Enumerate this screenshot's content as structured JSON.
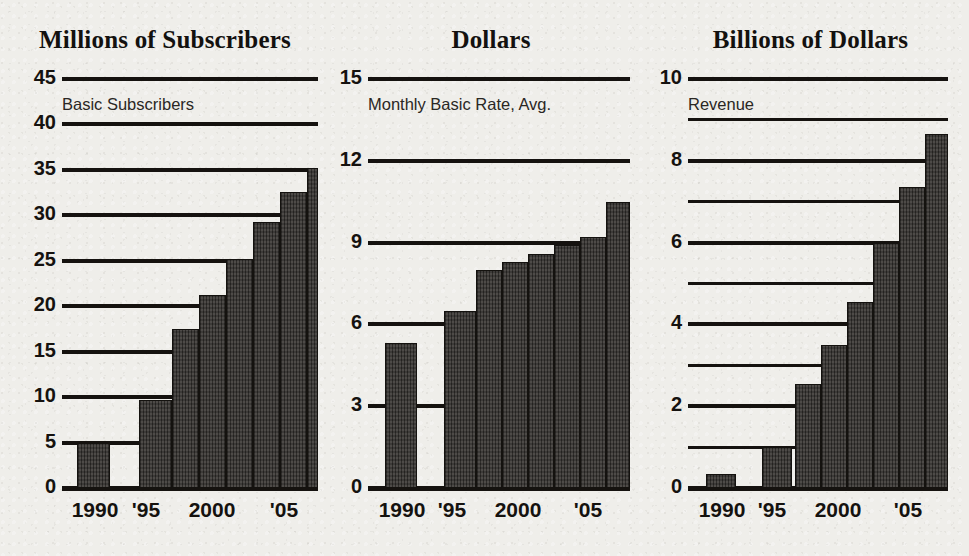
{
  "page": {
    "background_color": "#efeeea",
    "ink_color": "#15120f",
    "bar_color": "#3a3734"
  },
  "chart_data": [
    {
      "type": "bar",
      "title": "Millions of Subscribers",
      "subtitle": "Basic Subscribers",
      "xlabel": "",
      "ylabel": "Millions of Subscribers",
      "ylim": [
        0,
        45
      ],
      "grid": true,
      "legend": "none",
      "y_major_ticks": [
        0,
        5,
        10,
        15,
        20,
        25,
        30,
        35,
        40,
        45
      ],
      "y_minor_ticks": [],
      "x_tick_labels": [
        "1990",
        "'95",
        "2000",
        "'05"
      ],
      "categories": [
        "1990",
        "1995",
        "1998",
        "1999",
        "2000",
        "2001",
        "2002",
        "2003",
        "2004",
        "2005"
      ],
      "values": [
        5.0,
        9.7,
        17.5,
        21.2,
        25.2,
        29.3,
        32.6,
        35.2,
        35.2,
        35.2
      ]
    },
    {
      "type": "bar",
      "title": "Dollars",
      "subtitle": "Monthly Basic Rate, Avg.",
      "xlabel": "",
      "ylabel": "Dollars",
      "ylim": [
        0,
        15
      ],
      "grid": true,
      "legend": "none",
      "y_major_ticks": [
        0,
        3,
        6,
        9,
        12,
        15
      ],
      "y_minor_ticks": [],
      "x_tick_labels": [
        "1990",
        "'95",
        "2000",
        "'05"
      ],
      "categories": [
        "1990",
        "1995",
        "1998",
        "1999",
        "2000",
        "2001",
        "2002",
        "2003",
        "2004",
        "2005"
      ],
      "values": [
        5.3,
        6.5,
        8.0,
        8.3,
        8.6,
        8.9,
        9.2,
        10.5,
        10.5,
        10.5
      ]
    },
    {
      "type": "bar",
      "title": "Billions of Dollars",
      "subtitle": "Revenue",
      "xlabel": "",
      "ylabel": "Billions of Dollars",
      "ylim": [
        0,
        10
      ],
      "grid": true,
      "legend": "none",
      "y_major_ticks": [
        0,
        2,
        4,
        6,
        8,
        10
      ],
      "y_minor_ticks": [
        1,
        3,
        5,
        7,
        9
      ],
      "x_tick_labels": [
        "1990",
        "'95",
        "2000",
        "'05"
      ],
      "categories": [
        "1990",
        "1995",
        "1998",
        "1999",
        "2000",
        "2001",
        "2002",
        "2003",
        "2004",
        "2005"
      ],
      "values": [
        0.35,
        1.0,
        2.55,
        3.5,
        4.55,
        6.0,
        7.35,
        8.65,
        8.65,
        8.65
      ]
    }
  ],
  "panels": [
    {
      "title": "Millions of Subscribers",
      "subtitle": "Basic Subscribers",
      "ytick_labels": [
        "45",
        "40",
        "35",
        "30",
        "25",
        "20",
        "15",
        "10",
        "5",
        "0"
      ],
      "xtick_labels": [
        "1990",
        "'95",
        "2000",
        "'05"
      ]
    },
    {
      "title": "Dollars",
      "subtitle": "Monthly Basic Rate, Avg.",
      "ytick_labels": [
        "15",
        "12",
        "9",
        "6",
        "3",
        "0"
      ],
      "xtick_labels": [
        "1990",
        "'95",
        "2000",
        "'05"
      ]
    },
    {
      "title": "Billions of Dollars",
      "subtitle": "Revenue",
      "ytick_labels": [
        "10",
        "8",
        "6",
        "4",
        "2",
        "0"
      ],
      "xtick_labels": [
        "1990",
        "'95",
        "2000",
        "'05"
      ]
    }
  ]
}
